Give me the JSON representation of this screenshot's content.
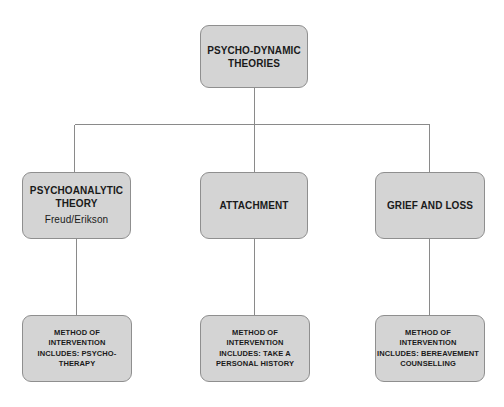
{
  "diagram": {
    "type": "hierarchy-tree",
    "title": "Psycho-Dynamic Theories",
    "colors": {
      "node_fill": "#d4d4d4",
      "node_border": "#8f8f8f",
      "connector": "#8a8a8a",
      "text": "#1a1a1a",
      "background": "#ffffff"
    },
    "root": {
      "label": "PSYCHO-DYNAMIC\nTHEORIES"
    },
    "branches": [
      {
        "label": "PSYCHOANALYTIC\nTHEORY",
        "sublabel": "Freud/Erikson",
        "method": "METHOD OF\nINTERVENTION\nINCLUDES: PSYCHO-\nTHERAPY"
      },
      {
        "label": "ATTACHMENT",
        "sublabel": "",
        "method": "METHOD OF\nINTERVENTION\nINCLUDES: TAKE A\nPERSONAL HISTORY"
      },
      {
        "label": "GRIEF AND LOSS",
        "sublabel": "",
        "method": "METHOD OF\nINTERVENTION\nINCLUDES: BEREAVEMENT\nCOUNSELLING"
      }
    ]
  }
}
